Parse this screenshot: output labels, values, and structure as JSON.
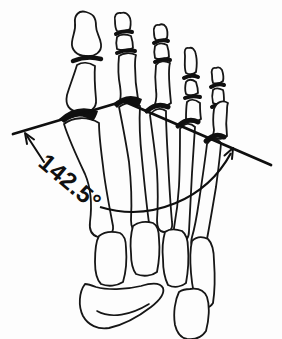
{
  "figure": {
    "angle_label": "142.5°",
    "colors": {
      "ink": "#101010",
      "background": "#fdfdfd"
    }
  }
}
